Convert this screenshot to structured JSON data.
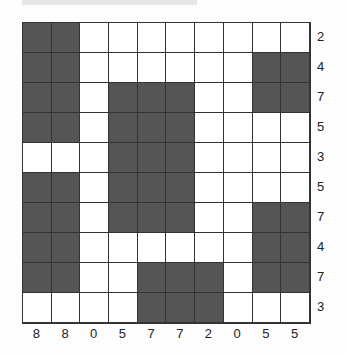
{
  "puzzle": {
    "type": "nonogram",
    "rows": 10,
    "cols": 10,
    "row_clues": [
      "2",
      "4",
      "7",
      "5",
      "3",
      "5",
      "7",
      "4",
      "7",
      "3"
    ],
    "col_clues": [
      "8",
      "8",
      "0",
      "5",
      "7",
      "7",
      "2",
      "0",
      "5",
      "5"
    ],
    "grid": [
      [
        1,
        1,
        0,
        0,
        0,
        0,
        0,
        0,
        0,
        0
      ],
      [
        1,
        1,
        0,
        0,
        0,
        0,
        0,
        0,
        1,
        1
      ],
      [
        1,
        1,
        0,
        1,
        1,
        1,
        0,
        0,
        1,
        1
      ],
      [
        1,
        1,
        0,
        1,
        1,
        1,
        0,
        0,
        0,
        0
      ],
      [
        0,
        0,
        0,
        1,
        1,
        1,
        0,
        0,
        0,
        0
      ],
      [
        1,
        1,
        0,
        1,
        1,
        1,
        0,
        0,
        0,
        0
      ],
      [
        1,
        1,
        0,
        1,
        1,
        1,
        0,
        0,
        1,
        1
      ],
      [
        1,
        1,
        0,
        0,
        0,
        0,
        0,
        0,
        1,
        1
      ],
      [
        1,
        1,
        0,
        0,
        1,
        1,
        1,
        0,
        1,
        1
      ],
      [
        0,
        0,
        0,
        0,
        1,
        1,
        1,
        0,
        0,
        0
      ]
    ],
    "colors": {
      "filled": "#555555",
      "empty": "#ffffff",
      "line": "#333333"
    }
  }
}
